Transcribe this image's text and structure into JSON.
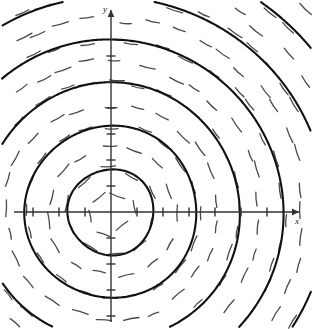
{
  "figure": {
    "type": "slope-field-plot",
    "background_color": "#ffffff",
    "ink_color": "#111111",
    "field_color": "#4a4a4a",
    "axis_color": "#333333",
    "width": 313,
    "height": 329
  },
  "axes": {
    "x_label": "x",
    "y_label": "y",
    "origin": {
      "x": 111,
      "y": 212
    },
    "x_axis": {
      "x_start": 14,
      "x_end": 299,
      "arrow": true
    },
    "y_axis": {
      "y_start": 10,
      "y_end": 322,
      "arrow": true
    },
    "tick_length": 9,
    "tick_spacing": 26,
    "x_ticks": [
      -3,
      -2,
      -1,
      1,
      2,
      3,
      4,
      5,
      6
    ],
    "y_ticks": [
      -6,
      -5,
      -4,
      -3,
      -2,
      -1,
      1,
      2,
      3,
      4,
      5,
      6
    ]
  },
  "chart_data": {
    "type": "scatter",
    "xlabel": "x",
    "ylabel": "y",
    "legend": [],
    "grid": false,
    "xlim": [
      -3.8,
      7.2
    ],
    "ylim": [
      -7.8,
      7.8
    ],
    "circles": {
      "center": [
        0,
        0
      ],
      "radii_px": [
        43,
        86,
        129,
        172,
        215,
        258
      ],
      "radii_units": [
        1.65,
        3.3,
        4.95,
        6.6,
        8.25,
        9.9
      ],
      "stroke_px": 2.1
    },
    "field": {
      "rule": "segment at (x,y) is tangent to circle of radius sqrt(x^2+y^2)",
      "ring_radii_px": [
        21,
        43,
        64,
        86,
        107,
        129,
        150,
        172,
        193,
        215,
        236,
        258,
        280
      ],
      "segment_length_px": 14,
      "stroke_px": 1.3
    }
  }
}
